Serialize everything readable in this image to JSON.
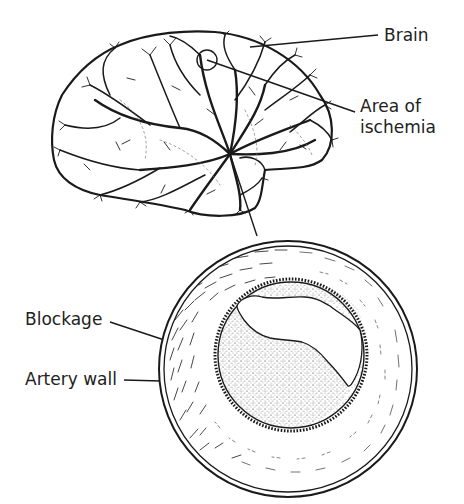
{
  "diagram": {
    "labels": {
      "brain": "Brain",
      "ischemia_line1": "Area of",
      "ischemia_line2": "ischemia",
      "blockage": "Blockage",
      "artery_wall": "Artery wall"
    },
    "colors": {
      "ink": "#1a1a1a",
      "background": "#ffffff"
    }
  }
}
